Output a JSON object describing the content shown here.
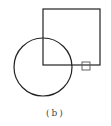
{
  "figure": {
    "caption": "(b)",
    "stroke_color": "#222222",
    "small_square_color": "#555555",
    "large_square": {
      "x": 43,
      "y": 9,
      "size": 57
    },
    "circle": {
      "cx": 43,
      "cy": 67,
      "r": 29
    },
    "small_square": {
      "x": 82,
      "y": 62,
      "size": 8
    }
  }
}
